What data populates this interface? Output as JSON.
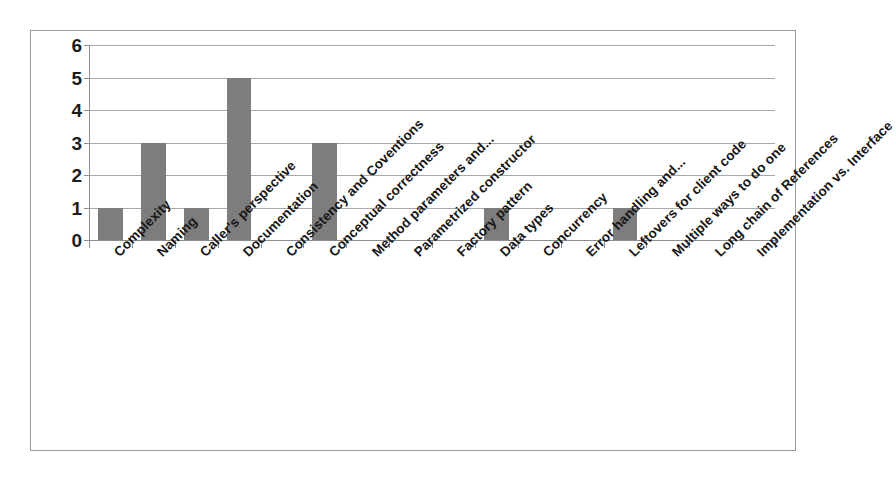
{
  "chart_data": {
    "type": "bar",
    "title": "",
    "subtitle": "",
    "xlabel": "",
    "ylabel": "",
    "ylim": [
      0,
      6
    ],
    "yticks": [
      0,
      1,
      2,
      3,
      4,
      5,
      6
    ],
    "grid": true,
    "legend": false,
    "legend_position": "none",
    "orientation": "vertical",
    "bar_color": "#7d7d7d",
    "gridline_color": "#a8a8a8",
    "axis_color": "#8d8d8d",
    "label_rotation_degrees": -45,
    "categories": [
      "Complexity",
      "Naming",
      "Caller's perspective",
      "Documentation",
      "Consistency and Coventions",
      "Conceptual correctness",
      "Method parameters and...",
      "Parametrized constructor",
      "Factory pattern",
      "Data types",
      "Concurrency",
      "Error handling and...",
      "Leftovers for client code",
      "Multiple ways to do one",
      "Long chain of References",
      "Implementation vs. Interface"
    ],
    "values": [
      1,
      3,
      1,
      5,
      0,
      3,
      0,
      0,
      0,
      1,
      0,
      0,
      1,
      0,
      0,
      0
    ]
  }
}
